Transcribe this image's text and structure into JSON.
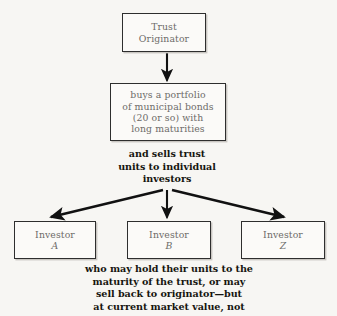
{
  "diagram": {
    "background_color": "#f7f6f3",
    "box_text_color": "#6d6b68",
    "caption_text_color": "#16150f",
    "box_border_color": "#2e2e2e",
    "arrow_color": "#111111",
    "nodes": {
      "trust_originator": {
        "line1": "Trust",
        "line2": "Originator"
      },
      "portfolio": {
        "line1": "buys a portfolio",
        "line2": "of municipal bonds",
        "line3": "(20 or so) with",
        "line4": "long maturities"
      },
      "investor_a": {
        "label": "Investor",
        "letter": "A"
      },
      "investor_b": {
        "label": "Investor",
        "letter": "B"
      },
      "investor_z": {
        "label": "Investor",
        "letter": "Z"
      }
    },
    "captions": {
      "sells_units": {
        "line1": "and sells trust",
        "line2": "units to individual",
        "line3": "investors"
      },
      "hold_units": {
        "line1": "who may hold their units to the",
        "line2": "maturity of the trust, or may",
        "line3": "sell back to originator—but",
        "line4": "at current market value, not"
      }
    }
  }
}
